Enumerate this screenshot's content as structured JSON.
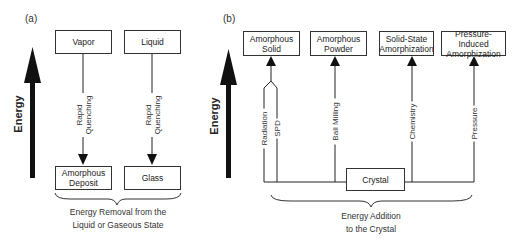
{
  "panel_a": {
    "label": "(a)",
    "axis_label": "Energy",
    "top_boxes": [
      "Vapor",
      "Liquid"
    ],
    "process_label_line1": "Rapid",
    "process_label_line2": "Quenching",
    "bottom_boxes": [
      {
        "line1": "Amorphous",
        "line2": "Deposit"
      },
      {
        "line1": "Glass",
        "line2": ""
      }
    ],
    "caption_line1": "Energy Removal from the",
    "caption_line2": "Liquid or Gaseous State"
  },
  "panel_b": {
    "label": "(b)",
    "axis_label": "Energy",
    "top_boxes": [
      {
        "line1": "Amorphous",
        "line2": "Solid"
      },
      {
        "line1": "Amorphous",
        "line2": "Powder"
      },
      {
        "line1": "Solid-State",
        "line2": "Amorphization"
      },
      {
        "line1": "Pressure-Induced",
        "line2": "Amorphization"
      }
    ],
    "processes": [
      "Radiation",
      "SPD",
      "Ball Milling",
      "Chemistry",
      "Pressure"
    ],
    "source_box": "Crystal",
    "caption_line1": "Energy Addition",
    "caption_line2": "to the Crystal"
  },
  "colors": {
    "line": "#222222",
    "text": "#333333",
    "background": "#ffffff"
  }
}
